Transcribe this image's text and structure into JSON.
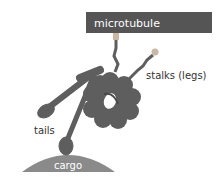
{
  "diagram": {
    "labels": {
      "microtubule": "microtubule",
      "stalks": "stalks (legs)",
      "tails": "tails",
      "cargo": "cargo"
    },
    "colors": {
      "microtubule": "#555555",
      "protein": "#5e5e5e",
      "cargo": "#8a8a8a",
      "stalk_tip": "#c9b7a3",
      "label_text": "#333333",
      "inner_text": "#ffffff"
    }
  }
}
